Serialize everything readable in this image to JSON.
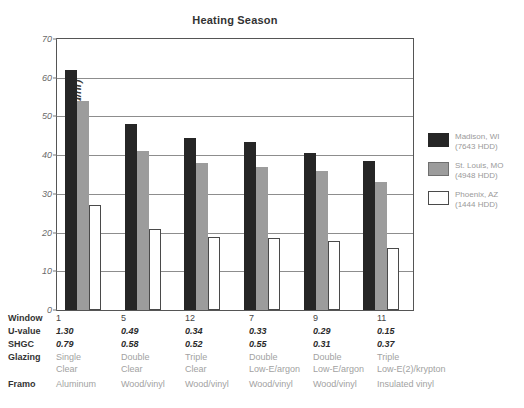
{
  "chart_data": {
    "type": "bar",
    "title": "Heating Season",
    "xlabel": "",
    "ylabel": "Peak Heating Load (kBtu/hr)",
    "ylim": [
      0,
      70
    ],
    "yticks": [
      0,
      10,
      20,
      30,
      40,
      50,
      60,
      70
    ],
    "ytick_labels": [
      "0",
      "10",
      "20",
      "30",
      "40",
      "50",
      "60",
      "70"
    ],
    "grid": true,
    "legend_position": "right",
    "categories": [
      "1",
      "5",
      "12",
      "7",
      "9",
      "11"
    ],
    "series": [
      {
        "name": "Madison, WI (7643 HDD)",
        "color": "#262626",
        "values": [
          62,
          48,
          44.5,
          43.5,
          40.5,
          38.5
        ]
      },
      {
        "name": "St. Louis, MO (4948 HDD)",
        "color": "#9c9c9c",
        "values": [
          54,
          41,
          38,
          37,
          35.8,
          33
        ]
      },
      {
        "name": "Phoenix, AZ (1444 HDD)",
        "color": "#ffffff",
        "values": [
          27,
          21,
          18.8,
          18.7,
          17.7,
          16
        ]
      }
    ]
  },
  "legend": {
    "entries": [
      {
        "city": "Madison, WI",
        "hdd": "(7643 HDD)"
      },
      {
        "city": "St. Louis, MO",
        "hdd": "(4948 HDD)"
      },
      {
        "city": "Phoenix, AZ",
        "hdd": "(1444 HDD)"
      }
    ]
  },
  "table": {
    "row_labels": {
      "window": "Window",
      "uvalue": "U-value",
      "shgc": "SHGC",
      "glazing": "Glazing",
      "frame": "Framo"
    },
    "columns": [
      {
        "window": "1",
        "uvalue": "1.30",
        "shgc": "0.79",
        "glazing_line1": "Single",
        "glazing_line2": "Clear",
        "frame": "Aluminum"
      },
      {
        "window": "5",
        "uvalue": "0.49",
        "shgc": "0.58",
        "glazing_line1": "Double",
        "glazing_line2": "Clear",
        "frame": "Wood/vinyl"
      },
      {
        "window": "12",
        "uvalue": "0.34",
        "shgc": "0.52",
        "glazing_line1": "Triple",
        "glazing_line2": "Clear",
        "frame": "Wood/vinyl"
      },
      {
        "window": "7",
        "uvalue": "0.33",
        "shgc": "0.55",
        "glazing_line1": "Double",
        "glazing_line2": "Low-E/argon",
        "frame": "Wood/vinyl"
      },
      {
        "window": "9",
        "uvalue": "0.29",
        "shgc": "0.31",
        "glazing_line1": "Double",
        "glazing_line2": "Low-E/argon",
        "frame": "Wood/vinyl"
      },
      {
        "window": "11",
        "uvalue": "0.15",
        "shgc": "0.37",
        "glazing_line1": "Triple",
        "glazing_line2": "Low-E(2)/krypton",
        "frame": "Insulated vinyl"
      }
    ]
  },
  "colors": {
    "series_madison": "#262626",
    "series_stlouis": "#9c9c9c",
    "series_phoenix": "#ffffff",
    "axis": "#555555",
    "grid": "#8d8d8d",
    "text": "#333333",
    "muted_text": "#a2a2a2"
  }
}
